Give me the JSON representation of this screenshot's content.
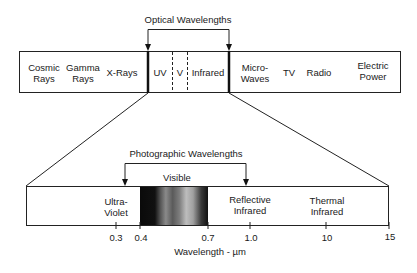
{
  "top_bar": {
    "bracket_label": "Optical Wavelengths",
    "segments": [
      {
        "label": "Cosmic\nRays"
      },
      {
        "label": "Gamma\nRays"
      },
      {
        "label": "X-Rays"
      },
      {
        "label": "UV"
      },
      {
        "label": "V"
      },
      {
        "label": "Infrared"
      },
      {
        "label": "Micro-\nWaves"
      },
      {
        "label": "TV"
      },
      {
        "label": "Radio"
      },
      {
        "label": "Electric\nPower"
      }
    ]
  },
  "bottom_bar": {
    "bracket_label": "Photographic Wavelengths",
    "visible_label": "Visible",
    "regions": [
      {
        "label": "Ultra-\nViolet"
      },
      {
        "label": "Reflective\nInfrared"
      },
      {
        "label": "Thermal\nInfrared"
      }
    ],
    "ticks": [
      "0.3",
      "0.4",
      "0.7",
      "1.0",
      "10",
      "15"
    ],
    "axis_label": "Wavelength - µm"
  }
}
